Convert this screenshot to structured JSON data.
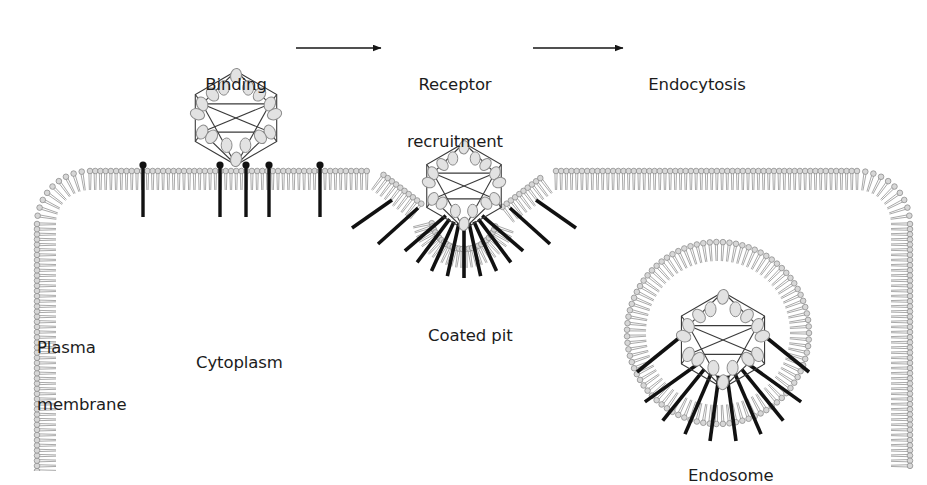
{
  "figure": {
    "background_color": "#ffffff",
    "text_color": "#1c1c1c",
    "membrane_head_color": "#b4b4b4",
    "membrane_tail_color": "#9a9a9a",
    "receptor_color": "#111111",
    "capsid_line_color": "#3a3a3a",
    "capsomere_color": "#8c8c8c"
  },
  "flow": {
    "steps": [
      {
        "id": "binding",
        "label": "Binding",
        "x": 236,
        "y": 37
      },
      {
        "id": "receptor-recruitment",
        "label": "Receptor",
        "label2": "recruitment",
        "x": 455,
        "y": 37
      },
      {
        "id": "endocytosis",
        "label": "Endocytosis",
        "x": 697,
        "y": 37
      }
    ],
    "arrows": [
      {
        "id": "arrow-binding-to-recruitment",
        "x1": 296,
        "y1": 48,
        "x2": 381,
        "y2": 48
      },
      {
        "id": "arrow-recruitment-to-endocytosis",
        "x1": 533,
        "y1": 48,
        "x2": 623,
        "y2": 48
      }
    ]
  },
  "labels": [
    {
      "id": "plasma-membrane",
      "line1": "Plasma",
      "line2": "membrane",
      "x": 37,
      "y": 300,
      "align": "left"
    },
    {
      "id": "cytoplasm",
      "line1": "Cytoplasm",
      "line2": "",
      "x": 196,
      "y": 315,
      "align": "left"
    },
    {
      "id": "coated-pit",
      "line1": "Coated pit",
      "line2": "",
      "x": 428,
      "y": 288,
      "align": "left"
    },
    {
      "id": "endosome",
      "line1": "Endosome",
      "line2": "",
      "x": 688,
      "y": 428,
      "align": "left"
    }
  ],
  "capsids": [
    {
      "id": "capsid-free",
      "cx": 236,
      "cy": 118,
      "r": 47
    },
    {
      "id": "capsid-coated-pit",
      "cx": 464,
      "cy": 186,
      "r": 43
    },
    {
      "id": "capsid-endosome",
      "cx": 723,
      "cy": 340,
      "r": 48
    }
  ],
  "membrane": {
    "outer_receptors_flat": [
      143,
      220,
      246,
      269,
      320
    ],
    "lipid_spacing": 5.2,
    "bilayer_thickness": 38,
    "head_radius": 2.8
  },
  "endosome": {
    "cx": 718,
    "cy": 333,
    "inner_radius": 72,
    "receptor_count": 8
  },
  "coated_pit": {
    "cx": 464,
    "cy": 200,
    "receptor_count": 9
  }
}
